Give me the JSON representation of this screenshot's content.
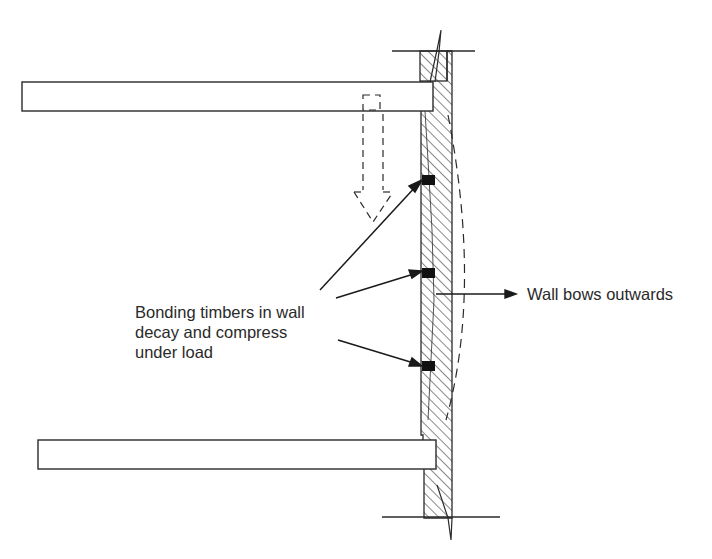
{
  "diagram": {
    "type": "structural-section",
    "colors": {
      "line": "#2a2a2a",
      "background": "#ffffff",
      "hatch": "#3a3a3a",
      "timber": "#111111"
    },
    "labels": {
      "bonding_line1": "Bonding timbers in wall",
      "bonding_line2": "decay and compress",
      "bonding_line3": "under load",
      "bow": "Wall bows outwards"
    },
    "elements": {
      "upper_floor_beam": "upper floor joist bearing into wall",
      "lower_floor_beam": "lower floor joist bearing into wall",
      "wall_section": "hatched masonry wall section",
      "bonding_timbers": 3,
      "load_arrow": "dashed downward load arrow",
      "bowed_profile": "dashed bowed wall outline"
    }
  }
}
